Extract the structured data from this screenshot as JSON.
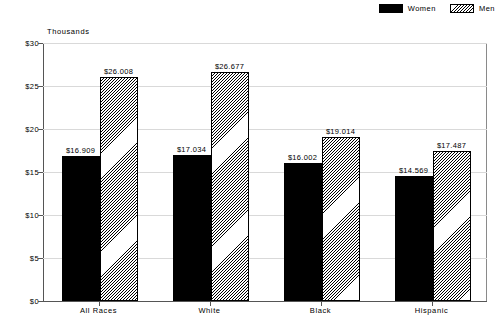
{
  "chart_data": {
    "type": "bar",
    "title": "",
    "subtitle": "",
    "xlabel": "",
    "ylabel": "Thousands",
    "ylim": [
      0,
      30
    ],
    "ytick_labels": [
      "$0",
      "$5",
      "$10",
      "$15",
      "$20",
      "$25",
      "$30"
    ],
    "ytick_values": [
      0,
      5,
      10,
      15,
      20,
      25,
      30
    ],
    "grid": true,
    "legend_position": "top-right",
    "categories": [
      "All Races",
      "White",
      "Black",
      "Hispanic"
    ],
    "series": [
      {
        "name": "Women",
        "color": "#000000",
        "fill": "solid",
        "values": [
          16.909,
          17.034,
          16.002,
          14.569
        ],
        "labels": [
          "$16.909",
          "$17.034",
          "$16.002",
          "$14.569"
        ]
      },
      {
        "name": "Men",
        "color": "#808080",
        "fill": "hatch",
        "values": [
          26.008,
          26.677,
          19.014,
          17.487
        ],
        "labels": [
          "$26.008",
          "$26.677",
          "$19.014",
          "$17.487"
        ]
      }
    ]
  },
  "legend": {
    "entries": [
      {
        "label": "Women",
        "swatch": "solid-black-swatch"
      },
      {
        "label": "Men",
        "swatch": "hatched-swatch"
      }
    ]
  },
  "axis": {
    "y_title": "Thousands"
  }
}
